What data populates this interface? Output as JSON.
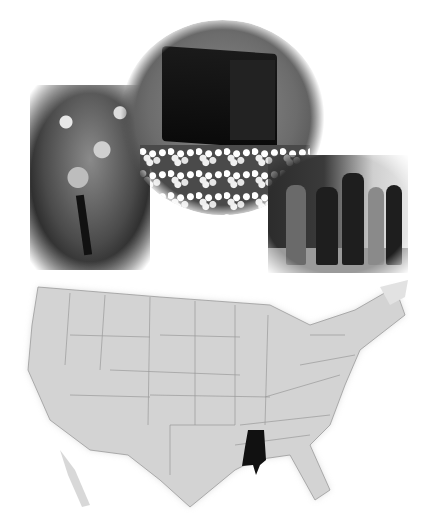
{
  "collage": {
    "photos": [
      {
        "id": "tree",
        "subject": "flowering tree",
        "tone": "grayscale"
      },
      {
        "id": "picker",
        "subject": "cotton picker machine in cotton field",
        "tone": "grayscale"
      },
      {
        "id": "people",
        "subject": "group of men in suits walking past rope barrier",
        "tone": "grayscale"
      }
    ],
    "map": {
      "subject": "contiguous United States outline map",
      "base_color": "#d3d3d3",
      "border_color": "#9a9a9a",
      "highlighted_state": "Mississippi",
      "highlight_color": "#111111"
    }
  }
}
